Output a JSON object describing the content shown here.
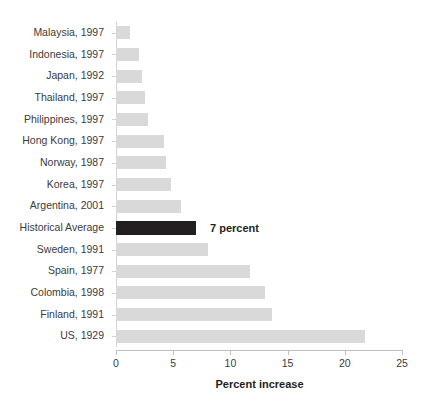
{
  "chart_data": {
    "type": "bar",
    "orientation": "horizontal",
    "title": "",
    "xlabel": "Percent increase",
    "ylabel": "",
    "xlim": [
      0,
      25
    ],
    "xticks": [
      0,
      5,
      10,
      15,
      20,
      25
    ],
    "xtick_labels": [
      "0",
      "5",
      "10",
      "15",
      "20",
      "25"
    ],
    "grid": false,
    "legend": false,
    "categories": [
      "Malaysia, 1997",
      "Indonesia, 1997",
      "Japan, 1992",
      "Thailand, 1997",
      "Philippines, 1997",
      "Hong Kong, 1997",
      "Norway, 1987",
      "Korea, 1997",
      "Argentina, 2001",
      "Historical Average",
      "Sweden, 1991",
      "Spain, 1977",
      "Colombia, 1998",
      "Finland, 1991",
      "US, 1929"
    ],
    "values": [
      1.2,
      2.0,
      2.3,
      2.5,
      2.8,
      4.2,
      4.4,
      4.8,
      5.7,
      7.0,
      8.0,
      11.7,
      13.0,
      13.6,
      21.8
    ],
    "highlight_index": 9,
    "annotations": [
      {
        "category": "Historical Average",
        "text": "7 percent",
        "value": 7.0
      }
    ],
    "colors": {
      "bar": "#d9d9d9",
      "bar_highlight": "#231f20",
      "axis": "#bfbfbf",
      "text": "#231f20",
      "tick_text": "#3b3b3b",
      "background": "#ffffff"
    }
  }
}
